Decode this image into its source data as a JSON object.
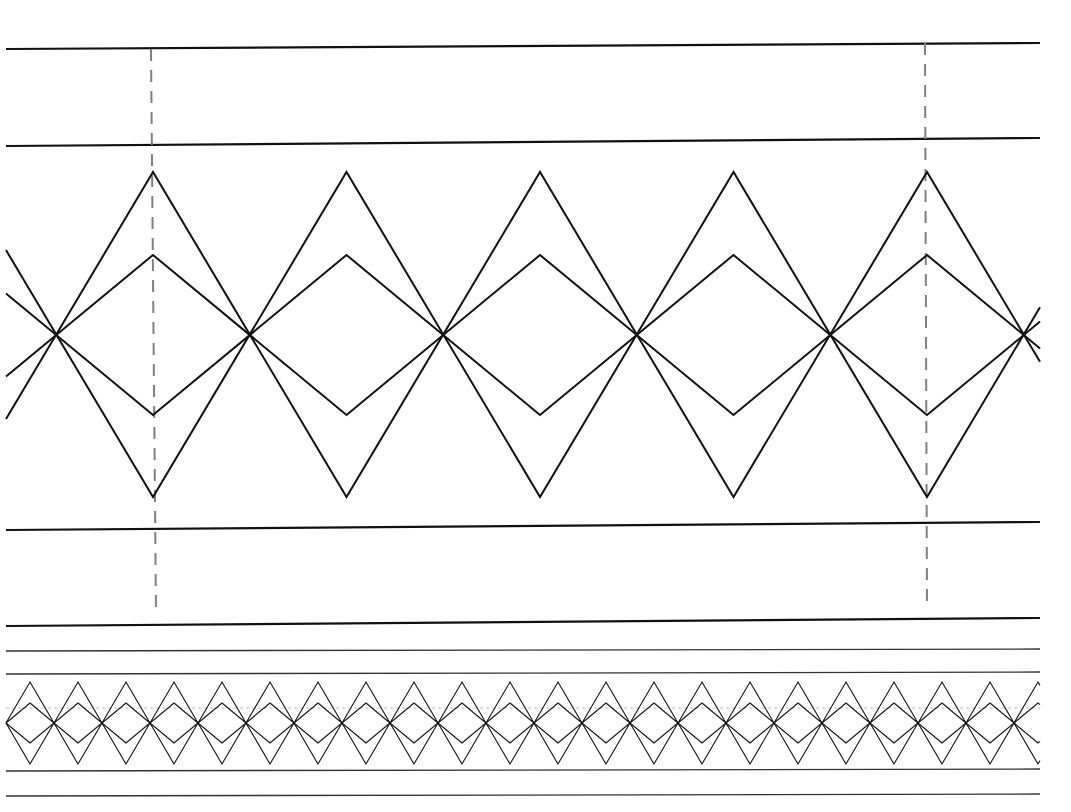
{
  "diagram": {
    "type": "braid-pattern",
    "line_color": "#111111",
    "guide_color": "#808080",
    "background": "#ffffff",
    "large_section": {
      "rails": [
        {
          "y_left": 49,
          "y_right": 43,
          "width": 2.2
        },
        {
          "y_left": 146,
          "y_right": 138,
          "width": 2.2
        },
        {
          "y_left": 530,
          "y_right": 522,
          "width": 2.2
        },
        {
          "y_left": 626,
          "y_right": 618,
          "width": 2.2
        }
      ],
      "guides": [
        {
          "x_top": 151,
          "x_bottom": 156,
          "y_top": 49,
          "y_bottom": 614
        },
        {
          "x_top": 925,
          "x_bottom": 927,
          "y_top": 43,
          "y_bottom": 610
        }
      ],
      "strands": {
        "outer_peak_y": 172,
        "outer_valley_y": 497,
        "inner_peak_y": 255,
        "inner_valley_y": 415,
        "first_peak_x": 153,
        "period": 387,
        "x_start": 6,
        "x_end": 1040,
        "width": 2
      }
    },
    "small_section": {
      "rails": [
        {
          "y": 651,
          "width": 1.3
        },
        {
          "y": 674,
          "width": 1.3
        },
        {
          "y": 771,
          "width": 1.3
        },
        {
          "y": 796,
          "width": 1.3
        }
      ],
      "dotted_line_y": 708,
      "strands": {
        "outer_peak_y": 682,
        "outer_valley_y": 764,
        "inner_peak_y": 703,
        "inner_valley_y": 743,
        "first_peak_x": 30,
        "period": 96,
        "x_start": 6,
        "x_end": 1040,
        "width": 1.1
      }
    }
  }
}
